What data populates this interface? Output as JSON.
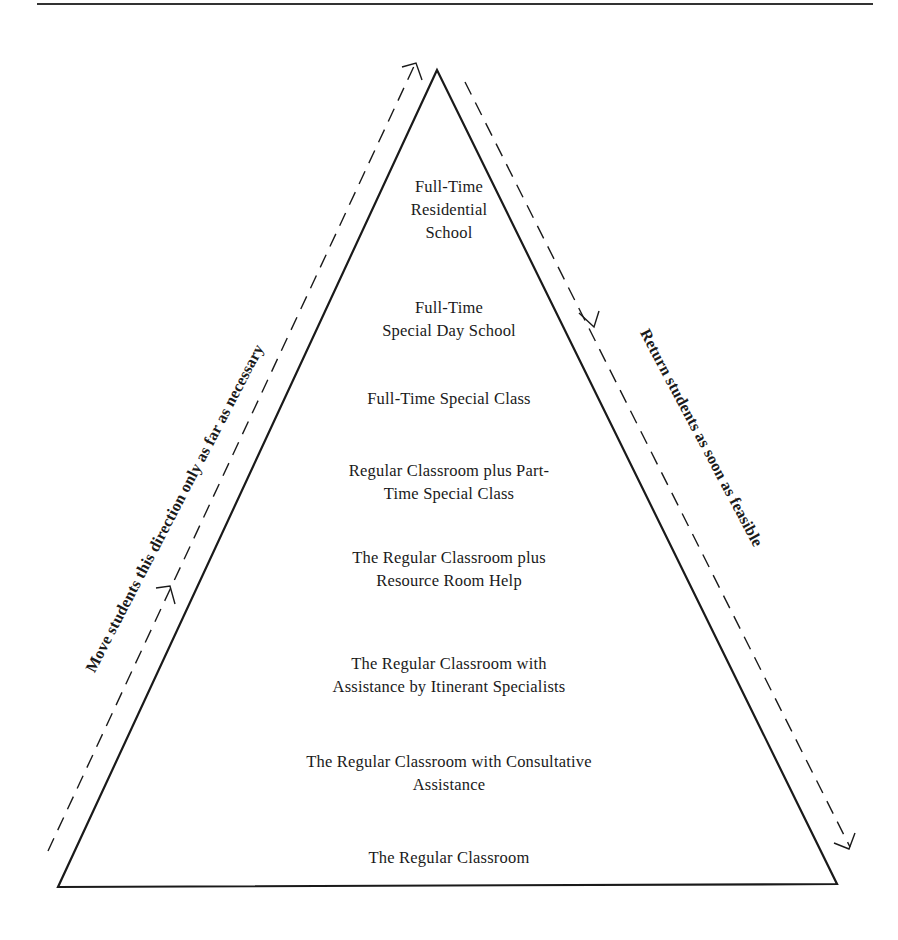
{
  "diagram": {
    "type": "continuum-of-services-pyramid",
    "levels": [
      {
        "lines": [
          "Full-Time",
          "Residential",
          "School"
        ]
      },
      {
        "lines": [
          "Full-Time",
          "Special Day School"
        ]
      },
      {
        "lines": [
          "Full-Time Special Class"
        ]
      },
      {
        "lines": [
          "Regular Classroom plus Part-",
          "Time Special Class"
        ]
      },
      {
        "lines": [
          "The Regular Classroom plus",
          "Resource Room Help"
        ]
      },
      {
        "lines": [
          "The Regular Classroom with",
          "Assistance by Itinerant Specialists"
        ]
      },
      {
        "lines": [
          "The Regular Classroom with Consultative",
          "Assistance"
        ]
      },
      {
        "lines": [
          "The Regular Classroom"
        ]
      }
    ],
    "left_arrow_label": "Move students this direction only as far as necessary",
    "right_arrow_label": "Return students as soon as feasible",
    "colors": {
      "line": "#1a1a1a",
      "background": "#ffffff"
    }
  }
}
